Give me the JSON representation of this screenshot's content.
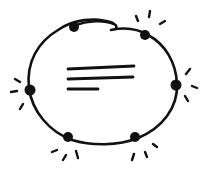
{
  "diagram": {
    "stroke_color": "#111111",
    "background": "#ffffff",
    "ring": {
      "cx": 103,
      "cy": 86,
      "rx": 73,
      "ry": 55,
      "gap_note": "break in ring near top center"
    },
    "nodes": [
      {
        "id": "node-top-left",
        "x": 74,
        "y": 27,
        "highlighted": false
      },
      {
        "id": "node-top-right",
        "x": 145,
        "y": 35,
        "highlighted": true
      },
      {
        "id": "node-right",
        "x": 176,
        "y": 85,
        "highlighted": true
      },
      {
        "id": "node-left",
        "x": 30,
        "y": 90,
        "highlighted": true
      },
      {
        "id": "node-bottom-left",
        "x": 68,
        "y": 137,
        "highlighted": true
      },
      {
        "id": "node-bottom-right",
        "x": 135,
        "y": 137,
        "highlighted": true
      }
    ],
    "center_text_lines": 3
  }
}
